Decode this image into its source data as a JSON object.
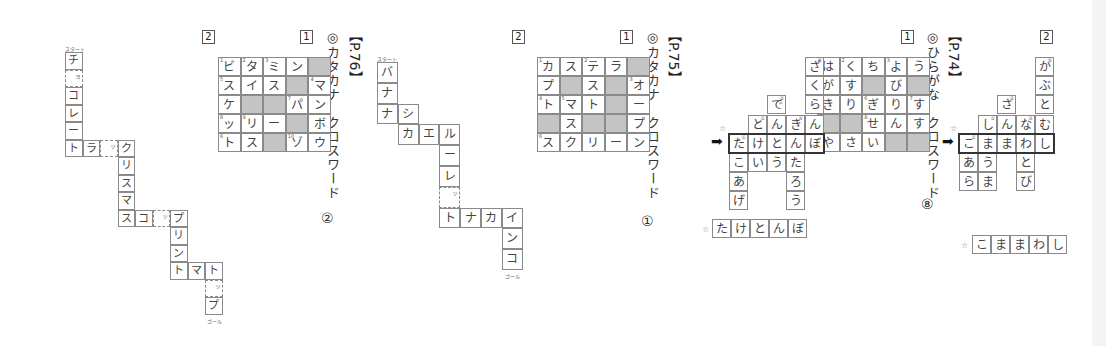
{
  "sections": [
    {
      "page": "【P.74】",
      "title": "◎ひらがな　クロスワード",
      "number": "⑧",
      "puzzle1": {
        "label": "1",
        "grid": [
          [
            {
              "c": "は",
              "n": "1"
            },
            {
              "c": "く",
              "n": "2"
            },
            {
              "c": "ち"
            },
            {
              "c": "よ",
              "n": "3"
            },
            {
              "c": "う"
            }
          ],
          [
            {
              "c": "が",
              "n": "4"
            },
            {
              "c": "す"
            },
            {
              "s": true
            },
            {
              "c": "び"
            },
            {
              "s": true
            }
          ],
          [
            {
              "c": "き",
              "n": "5"
            },
            {
              "c": "り"
            },
            {
              "c": "ぎ",
              "n": "6"
            },
            {
              "c": "り"
            },
            {
              "c": "す",
              "n": "7"
            }
          ],
          [
            {
              "s": true
            },
            {
              "s": true
            },
            {
              "c": "せ",
              "n": "8"
            },
            {
              "c": "ん"
            },
            {
              "c": "す"
            }
          ],
          [
            {
              "c": "や",
              "n": "9"
            },
            {
              "c": "さ"
            },
            {
              "c": "い"
            },
            {
              "s": true
            },
            {
              "s": true
            }
          ]
        ]
      },
      "puzzle2": {
        "label": "2",
        "columns": [
          [
            "か",
            "ぶ",
            "と",
            "む",
            "し"
          ],
          [
            "な",
            "わ",
            "と",
            "び"
          ],
          [
            "さ",
            "ん",
            "ま"
          ],
          [
            "し",
            "ま",
            "う",
            "ま"
          ],
          [
            "こ",
            "あ",
            "ら"
          ]
        ],
        "highlight_row": [
          "こ",
          "ま",
          "ま",
          "わ",
          "し"
        ],
        "answer_label": "☆",
        "answer": [
          "こ",
          "ま",
          "ま",
          "わ",
          "し"
        ]
      }
    },
    {
      "page": "【P.75】",
      "title": "◎カタカナ　クロスワード",
      "number": "①",
      "puzzle1": {
        "label": "1",
        "grid": [
          [
            {
              "c": "カ",
              "n": "1"
            },
            {
              "c": "ス"
            },
            {
              "c": "テ",
              "n": "2"
            },
            {
              "c": "ラ"
            },
            {
              "s": true
            }
          ],
          [
            {
              "c": "プ"
            },
            {
              "s": true
            },
            {
              "c": "ス"
            },
            {
              "s": true
            },
            {
              "c": "オ",
              "n": "3"
            }
          ],
          [
            {
              "c": "ト",
              "n": "4"
            },
            {
              "c": "マ",
              "n": "5"
            },
            {
              "c": "ト"
            },
            {
              "s": true
            },
            {
              "c": "ー"
            }
          ],
          [
            {
              "s": true
            },
            {
              "c": "ス"
            },
            {
              "s": true
            },
            {
              "s": true
            },
            {
              "c": "プ"
            }
          ],
          [
            {
              "c": "ス",
              "n": "6"
            },
            {
              "c": "ク"
            },
            {
              "c": "リ"
            },
            {
              "c": "ー"
            },
            {
              "c": "ン"
            }
          ]
        ]
      },
      "puzzle2": {
        "label": "2",
        "highlight_row": [
          "た",
          "け",
          "と",
          "ん",
          "ぼ"
        ],
        "answer_label": "☆",
        "answer": [
          "た",
          "け",
          "と",
          "ん",
          "ぼ"
        ],
        "cells": {
          "sakuranbo": [
            "ざ",
            "く",
            "ら",
            "ん",
            "ぼ"
          ],
          "kintarou": [
            "き",
            "ん",
            "た",
            "ろ",
            "う"
          ],
          "dentou": [
            "で",
            "ん",
            "と",
            "う"
          ],
          "toke": [
            "と",
            "け",
            "い"
          ],
          "takoage": [
            "た",
            "こ",
            "あ",
            "げ"
          ]
        }
      },
      "path": {
        "start_label": "スタート",
        "goal_label": "ゴール",
        "small_tsu": "ッ"
      }
    },
    {
      "page": "【P.76】",
      "title": "◎カタカナ　クロスワード",
      "number": "②",
      "puzzle1": {
        "label": "1",
        "grid": [
          [
            {
              "c": "ビ",
              "n": "1"
            },
            {
              "c": "タ",
              "n": "2"
            },
            {
              "c": "ミ",
              "n": "3"
            },
            {
              "c": "ン"
            },
            {
              "s": true
            }
          ],
          [
            {
              "c": "ス",
              "n": "5"
            },
            {
              "c": "イ"
            },
            {
              "c": "ス"
            },
            {
              "s": true
            },
            {
              "c": "マ",
              "n": "4"
            }
          ],
          [
            {
              "c": "ケ"
            },
            {
              "s": true
            },
            {
              "s": true
            },
            {
              "c": "パ",
              "n": "7"
            },
            {
              "c": "ン"
            }
          ],
          [
            {
              "c": "ッ",
              "n": "8"
            },
            {
              "c": "リ",
              "n": "9"
            },
            {
              "c": "ー"
            },
            {
              "s": true
            },
            {
              "c": "ボ"
            }
          ],
          [
            {
              "c": "ト",
              "n": "6"
            },
            {
              "c": "ス"
            },
            {
              "s": true
            },
            {
              "c": "ゾ",
              "n": "10"
            },
            {
              "c": "ウ"
            }
          ]
        ]
      },
      "puzzle2": {
        "label": "2"
      },
      "path": {
        "start_label": "スタート",
        "goal_label": "ゴール",
        "small_yo": "ョ",
        "small_tsu": "ッ"
      }
    }
  ],
  "p75_path_cells": [
    "バ",
    "ナ",
    "ナ",
    "シ",
    "カ",
    "エ",
    "ル",
    "ー",
    "レ",
    "ッ",
    "ト",
    "ナ",
    "カ",
    "イ",
    "ン",
    "コ"
  ],
  "p76_path_cells": [
    "チ",
    "ョ",
    "コ",
    "レ",
    "ー",
    "ト",
    "ラ",
    "ッ",
    "ク",
    "リ",
    "ス",
    "マ",
    "ス",
    "コ",
    "ッ",
    "プ",
    "リ",
    "ン",
    "ト",
    "マ",
    "ト",
    "ッ",
    "プ"
  ]
}
